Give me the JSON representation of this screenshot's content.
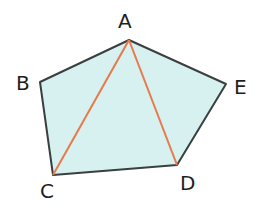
{
  "diagram": {
    "type": "pentagon-with-diagonals",
    "colors": {
      "fill": "#d6f1ef",
      "edge": "#3a3f3f",
      "diagonal": "#e8794a",
      "label": "#1e1e1e"
    },
    "vertices": [
      {
        "name": "A",
        "x": 129,
        "y": 40,
        "label_x": 118,
        "label_y": 28
      },
      {
        "name": "B",
        "x": 40,
        "y": 82,
        "label_x": 16,
        "label_y": 90
      },
      {
        "name": "C",
        "x": 53,
        "y": 175,
        "label_x": 40,
        "label_y": 198
      },
      {
        "name": "D",
        "x": 177,
        "y": 165,
        "label_x": 180,
        "label_y": 190
      },
      {
        "name": "E",
        "x": 226,
        "y": 84,
        "label_x": 234,
        "label_y": 94
      }
    ],
    "diagonals": [
      {
        "from": "A",
        "to": "C"
      },
      {
        "from": "A",
        "to": "D"
      }
    ]
  }
}
